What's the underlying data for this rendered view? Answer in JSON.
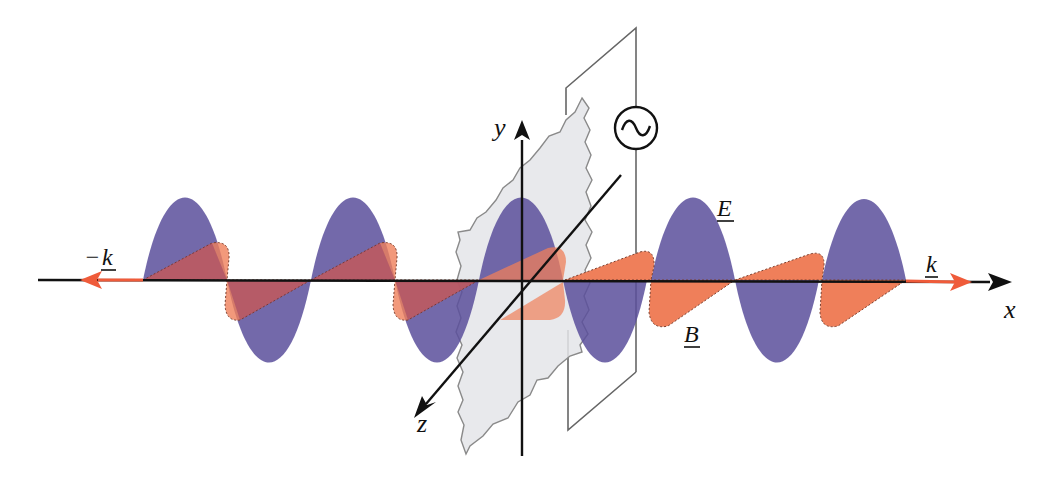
{
  "diagram": {
    "colors": {
      "e_field": "#5b4f9b",
      "b_field": "#ef7f5a",
      "overlap": "#7a2f6a",
      "axis": "#111111",
      "k_vector": "#ef5b3a",
      "plane_fill": "#e6e7ea",
      "plane_stroke": "#8a8a8a",
      "frame_stroke": "#666666"
    },
    "labels": {
      "e_field": "E",
      "b_field": "B",
      "k_forward": "k",
      "k_backward_sign": "−",
      "k_backward": "k",
      "x_axis": "x",
      "y_axis": "y",
      "z_axis": "z"
    },
    "source": {
      "symbol": "∿",
      "name": "AC source"
    },
    "wave": {
      "axis_y": 280,
      "e_amplitude": 85,
      "b_amplitude": 38,
      "half_wavelength_px": 84,
      "start_x": 143,
      "end_x": 906
    }
  }
}
